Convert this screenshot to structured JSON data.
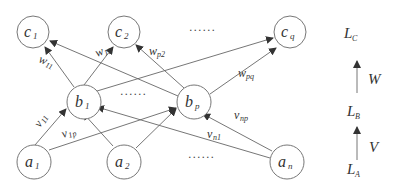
{
  "diagram": {
    "type": "two-layer network mapping",
    "layers": {
      "C": {
        "nodes": [
          {
            "base": "c",
            "sub": "1"
          },
          {
            "base": "c",
            "sub": "2"
          },
          {
            "base": "c",
            "sub": "q"
          }
        ],
        "ellipsis": "......"
      },
      "B": {
        "nodes": [
          {
            "base": "b",
            "sub": "1"
          },
          {
            "base": "b",
            "sub": "p"
          }
        ],
        "ellipsis": "......"
      },
      "A": {
        "nodes": [
          {
            "base": "a",
            "sub": "1"
          },
          {
            "base": "a",
            "sub": "2"
          },
          {
            "base": "a",
            "sub": "n"
          }
        ],
        "ellipsis": "......"
      }
    },
    "edge_labels": {
      "w11": {
        "base": "w",
        "sub": "11"
      },
      "w12": {
        "base": "w",
        "sub": "12"
      },
      "wp2": {
        "base": "w",
        "sub": "p2"
      },
      "wpq": {
        "base": "w",
        "sub": "pq"
      },
      "v11": {
        "base": "v",
        "sub": "11"
      },
      "v1p": {
        "base": "v",
        "sub": "1p"
      },
      "vn1": {
        "base": "v",
        "sub": "n1"
      },
      "vnp": {
        "base": "v",
        "sub": "np"
      }
    },
    "legend": {
      "LC": {
        "base": "L",
        "sub": "C"
      },
      "W": "W",
      "LB": {
        "base": "L",
        "sub": "B"
      },
      "V": "V",
      "LA": {
        "base": "L",
        "sub": "A"
      }
    },
    "colors": {
      "stroke": "#666666",
      "text": "#333333",
      "background": "#ffffff"
    }
  }
}
